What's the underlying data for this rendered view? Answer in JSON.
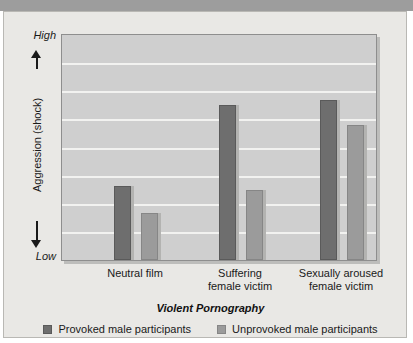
{
  "figure": {
    "background_color": "#e9e8e5",
    "top_strip_color": "#9d9d9d",
    "plot_background_color": "#cfcfcf",
    "gridline_color": "#f2f2f0"
  },
  "axes": {
    "y_title": "Aggression (shock)",
    "y_high_label": "High",
    "y_low_label": "Low",
    "x_title": "Violent Pornography"
  },
  "legend": {
    "items": [
      {
        "label": "Provoked male participants",
        "color": "#6e6e6e",
        "key": "provoked"
      },
      {
        "label": "Unprovoked male participants",
        "color": "#9b9b9b",
        "key": "unprovoked"
      }
    ]
  },
  "chart_data": {
    "type": "bar",
    "title": "",
    "subtitle": "",
    "xlabel": "Violent Pornography",
    "ylabel": "Aggression (shock)",
    "ylim": [
      0,
      100
    ],
    "y_tick_labels": [
      "Low",
      "High"
    ],
    "grid": true,
    "gridline_count": 7,
    "legend_position": "bottom",
    "categories": [
      "Neutral film",
      "Suffering female victim",
      "Sexually aroused female victim"
    ],
    "category_lines": [
      [
        "Neutral film"
      ],
      [
        "Suffering",
        "female victim"
      ],
      [
        "Sexually aroused",
        "female victim"
      ]
    ],
    "series": [
      {
        "name": "Provoked male participants",
        "color": "#6e6e6e",
        "values": [
          33,
          69,
          71
        ]
      },
      {
        "name": "Unprovoked male participants",
        "color": "#9b9b9b",
        "values": [
          21,
          31,
          60
        ]
      }
    ]
  }
}
